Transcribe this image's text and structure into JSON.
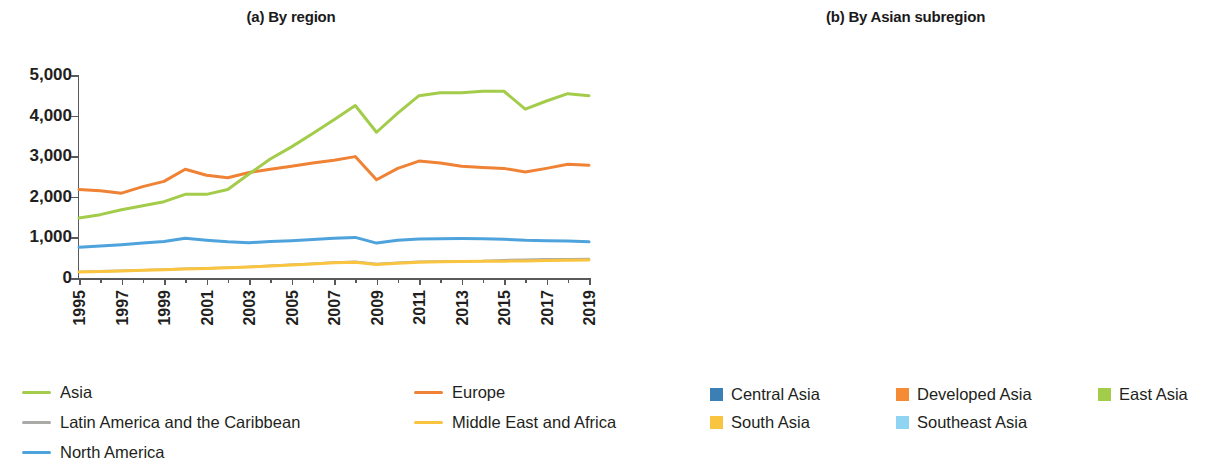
{
  "figure": {
    "panels": [
      {
        "id": "a",
        "title": "(a)  By region"
      },
      {
        "id": "b",
        "title": "(b) By Asian subregion"
      }
    ]
  },
  "axis": {
    "y_ticks": [
      "5,000",
      "4,000",
      "3,000",
      "2,000",
      "1,000",
      "0"
    ],
    "x_ticks": [
      "1995",
      "1997",
      "1999",
      "2001",
      "2003",
      "2005",
      "2007",
      "2009",
      "2011",
      "2013",
      "2015",
      "2017",
      "2019"
    ]
  },
  "legend_a": {
    "items": [
      {
        "label": "Asia",
        "color": "#a3cc4a"
      },
      {
        "label": "Europe",
        "color": "#ef8234"
      },
      {
        "label": "Latin America and the Caribbean",
        "color": "#a9aaa8"
      },
      {
        "label": "Middle East and Africa",
        "color": "#f9c440"
      },
      {
        "label": "North America",
        "color": "#4ea3dc"
      }
    ]
  },
  "legend_b": {
    "items": [
      {
        "label": "Central Asia",
        "color": "#3b7fb4"
      },
      {
        "label": "Developed Asia",
        "color": "#f58b34"
      },
      {
        "label": "East Asia",
        "color": "#a3cc4a"
      },
      {
        "label": "South Asia",
        "color": "#f9c440"
      },
      {
        "label": "Southeast Asia",
        "color": "#8fd4f2"
      }
    ]
  },
  "chart_data": [
    {
      "type": "line",
      "title": "(a)  By region",
      "xlabel": "",
      "ylabel": "",
      "ylim": [
        0,
        5000
      ],
      "grid": false,
      "legend_position": "bottom-left",
      "x": [
        1995,
        1996,
        1997,
        1998,
        1999,
        2000,
        2001,
        2002,
        2003,
        2004,
        2005,
        2006,
        2007,
        2008,
        2009,
        2010,
        2011,
        2012,
        2013,
        2014,
        2015,
        2016,
        2017,
        2018,
        2019
      ],
      "series": [
        {
          "name": "Asia",
          "color": "#a3cc4a",
          "values": [
            1480,
            1560,
            1680,
            1780,
            1880,
            2060,
            2060,
            2180,
            2560,
            2930,
            3230,
            3560,
            3900,
            4250,
            3590,
            4060,
            4490,
            4560,
            4560,
            4600,
            4600,
            4160,
            4360,
            4540,
            4490
          ]
        },
        {
          "name": "Europe",
          "color": "#ef8234",
          "values": [
            2180,
            2150,
            2090,
            2250,
            2380,
            2680,
            2530,
            2470,
            2600,
            2680,
            2750,
            2830,
            2900,
            2990,
            2420,
            2700,
            2880,
            2830,
            2750,
            2720,
            2700,
            2610,
            2700,
            2800,
            2780
          ]
        },
        {
          "name": "Latin America and the Caribbean",
          "color": "#a9aaa8",
          "values": [
            150,
            165,
            180,
            195,
            210,
            230,
            240,
            255,
            275,
            300,
            330,
            355,
            385,
            400,
            345,
            375,
            400,
            410,
            415,
            420,
            440,
            450,
            460,
            465,
            470
          ]
        },
        {
          "name": "Middle East and Africa",
          "color": "#f9c440",
          "values": [
            150,
            160,
            175,
            190,
            205,
            220,
            235,
            250,
            270,
            295,
            320,
            345,
            375,
            390,
            335,
            365,
            390,
            400,
            405,
            410,
            415,
            420,
            430,
            440,
            445
          ]
        },
        {
          "name": "North America",
          "color": "#4ea3dc",
          "values": [
            760,
            790,
            820,
            860,
            900,
            980,
            930,
            890,
            870,
            900,
            920,
            950,
            980,
            1000,
            860,
            930,
            960,
            965,
            970,
            965,
            955,
            930,
            920,
            910,
            890
          ]
        }
      ]
    },
    {
      "type": "bar",
      "stacked": true,
      "title": "(b) By Asian subregion",
      "xlabel": "",
      "ylabel": "",
      "ylim": [
        0,
        5000
      ],
      "grid": false,
      "legend_position": "bottom",
      "categories": [
        1995,
        1996,
        1997,
        1998,
        1999,
        2000,
        2001,
        2002,
        2003,
        2004,
        2005,
        2006,
        2007,
        2008,
        2009,
        2010,
        2011,
        2012,
        2013,
        2014,
        2015,
        2016,
        2017,
        2018,
        2019
      ],
      "series": [
        {
          "name": "Central Asia",
          "color": "#3b7fb4",
          "values": [
            10,
            12,
            14,
            16,
            18,
            22,
            24,
            26,
            32,
            40,
            48,
            55,
            62,
            70,
            60,
            72,
            82,
            88,
            90,
            90,
            85,
            72,
            76,
            82,
            80
          ]
        },
        {
          "name": "Developed Asia",
          "color": "#f58b34",
          "values": [
            290,
            300,
            300,
            300,
            300,
            320,
            300,
            300,
            330,
            360,
            400,
            430,
            460,
            510,
            440,
            490,
            520,
            530,
            530,
            525,
            520,
            490,
            500,
            520,
            510
          ]
        },
        {
          "name": "East Asia",
          "color": "#a3cc4a",
          "values": [
            810,
            850,
            930,
            1000,
            1030,
            1130,
            1150,
            1260,
            1490,
            1880,
            2190,
            2480,
            2690,
            2640,
            2100,
            2430,
            2700,
            2750,
            2740,
            2700,
            2730,
            2550,
            2660,
            2720,
            2640
          ]
        },
        {
          "name": "South Asia",
          "color": "#f9c440",
          "values": [
            70,
            78,
            90,
            100,
            110,
            120,
            130,
            140,
            180,
            230,
            290,
            340,
            400,
            460,
            420,
            470,
            520,
            540,
            560,
            570,
            560,
            510,
            540,
            560,
            560
          ]
        },
        {
          "name": "Southeast Asia",
          "color": "#8fd4f2",
          "values": [
            310,
            300,
            340,
            390,
            390,
            460,
            450,
            450,
            500,
            560,
            610,
            650,
            640,
            670,
            580,
            680,
            700,
            710,
            710,
            720,
            700,
            600,
            600,
            650,
            650
          ]
        }
      ]
    }
  ]
}
